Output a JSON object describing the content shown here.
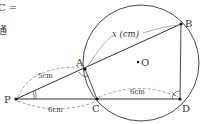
{
  "text_fragments": {
    "line1": "C =",
    "line2": "通"
  },
  "diagram": {
    "points": {
      "P": {
        "label": "P",
        "x": 16,
        "y": 99
      },
      "A": {
        "label": "A",
        "x": 85,
        "y": 69
      },
      "B": {
        "label": "B",
        "x": 181,
        "y": 24
      },
      "C": {
        "label": "C",
        "x": 97,
        "y": 99
      },
      "D": {
        "label": "D",
        "x": 180,
        "y": 99
      },
      "O": {
        "label": "O",
        "x": 138,
        "y": 62
      }
    },
    "circle": {
      "cx": 141,
      "cy": 63,
      "r": 58
    },
    "lengths": {
      "PA": "5cm",
      "PC": "6cm",
      "CD": "6cm",
      "AB": "x (cm)"
    },
    "colors": {
      "line": "#333333",
      "dash": "#777777"
    }
  }
}
